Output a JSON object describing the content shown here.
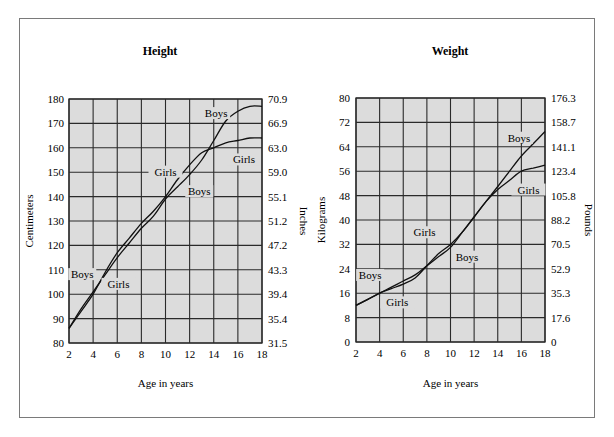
{
  "chart_data": [
    {
      "type": "line",
      "title": "Height",
      "xlabel": "Age in years",
      "ylabel": "Centimeters",
      "ylabel_right": "Inches",
      "xlim": [
        2,
        18
      ],
      "ylim": [
        80,
        180
      ],
      "x_ticks": [
        2,
        4,
        6,
        8,
        10,
        12,
        14,
        16,
        18
      ],
      "y_ticks": [
        80,
        90,
        100,
        110,
        120,
        130,
        140,
        150,
        160,
        170,
        180
      ],
      "y_ticks_right": [
        "31.5",
        "35.4",
        "39.4",
        "43.3",
        "47.2",
        "51.2",
        "55.1",
        "59.0",
        "63.0",
        "66.9",
        "70.9"
      ],
      "grid": true,
      "series": [
        {
          "name": "Boys",
          "x": [
            2,
            3,
            4,
            5,
            6,
            7,
            8,
            9,
            10,
            11,
            12,
            13,
            14,
            15,
            16,
            17,
            18
          ],
          "values": [
            86,
            94,
            101,
            108,
            115,
            121,
            127,
            132,
            139,
            144,
            149,
            155,
            163,
            171,
            175,
            177,
            177
          ]
        },
        {
          "name": "Girls",
          "x": [
            2,
            3,
            4,
            5,
            6,
            7,
            8,
            9,
            10,
            11,
            12,
            13,
            14,
            15,
            16,
            17,
            18
          ],
          "values": [
            86,
            93,
            100,
            109,
            117,
            123,
            129,
            134,
            140,
            147,
            153,
            158,
            160,
            162,
            163,
            164,
            164
          ]
        }
      ],
      "annotations": [
        {
          "text": "Boys",
          "x": 14.2,
          "y": 173
        },
        {
          "text": "Girls",
          "x": 10,
          "y": 149
        },
        {
          "text": "Boys",
          "x": 12.8,
          "y": 141
        },
        {
          "text": "Girls",
          "x": 16.5,
          "y": 154
        },
        {
          "text": "Boys",
          "x": 3.1,
          "y": 107
        },
        {
          "text": "Girls",
          "x": 6.1,
          "y": 103
        }
      ]
    },
    {
      "type": "line",
      "title": "Weight",
      "xlabel": "Age in years",
      "ylabel": "Kilograms",
      "ylabel_right": "Pounds",
      "xlim": [
        2,
        18
      ],
      "ylim": [
        0,
        80
      ],
      "x_ticks": [
        2,
        4,
        6,
        8,
        10,
        12,
        14,
        16,
        18
      ],
      "y_ticks": [
        0,
        8,
        16,
        24,
        32,
        40,
        48,
        56,
        64,
        72,
        80
      ],
      "y_ticks_right": [
        "0",
        "17.6",
        "35.3",
        "52.9",
        "70.5",
        "88.2",
        "105.8",
        "123.4",
        "141.1",
        "158.7",
        "176.3"
      ],
      "grid": true,
      "series": [
        {
          "name": "Boys",
          "x": [
            2,
            3,
            4,
            5,
            6,
            7,
            8,
            9,
            10,
            11,
            12,
            13,
            14,
            15,
            16,
            17,
            18
          ],
          "values": [
            12,
            14,
            16,
            18,
            20,
            22,
            25,
            28,
            31,
            36,
            41,
            46,
            51,
            56,
            61,
            65,
            69
          ]
        },
        {
          "name": "Girls",
          "x": [
            2,
            3,
            4,
            5,
            6,
            7,
            8,
            9,
            10,
            11,
            12,
            13,
            14,
            15,
            16,
            17,
            18
          ],
          "values": [
            12,
            14,
            16,
            17.5,
            19,
            21,
            25,
            29,
            32,
            36,
            41,
            46,
            50,
            53,
            56,
            57,
            58
          ]
        }
      ],
      "annotations": [
        {
          "text": "Boys",
          "x": 15.8,
          "y": 66
        },
        {
          "text": "Girls",
          "x": 16.6,
          "y": 49
        },
        {
          "text": "Girls",
          "x": 7.8,
          "y": 35
        },
        {
          "text": "Boys",
          "x": 11.4,
          "y": 27
        },
        {
          "text": "Boys",
          "x": 3.2,
          "y": 21
        },
        {
          "text": "Girls",
          "x": 5.5,
          "y": 12
        }
      ]
    }
  ]
}
